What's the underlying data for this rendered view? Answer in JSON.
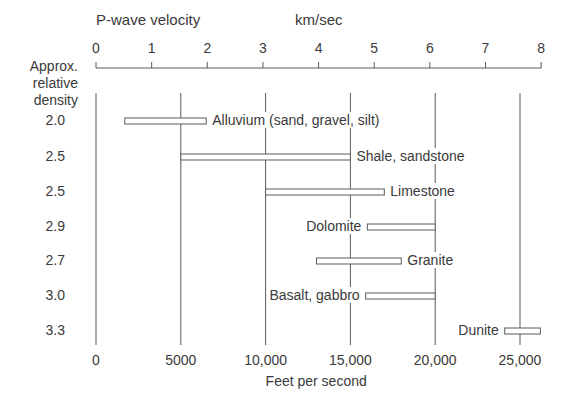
{
  "chart_data": {
    "type": "range-bar",
    "title": "P-wave velocity",
    "top_axis": {
      "label": "km/sec",
      "title": "P-wave velocity",
      "ticks": [
        0,
        1,
        2,
        3,
        4,
        5,
        6,
        7,
        8
      ],
      "range": [
        0,
        8
      ]
    },
    "bottom_axis": {
      "label": "Feet per second",
      "ticks": [
        "0",
        "5000",
        "10,000",
        "15,000",
        "20,000",
        "25,000"
      ],
      "tick_values": [
        0,
        5000,
        10000,
        15000,
        20000,
        25000
      ],
      "range": [
        0,
        26250
      ]
    },
    "left_column_header": [
      "Approx.",
      "relative",
      "density"
    ],
    "rows": [
      {
        "name": "Alluvium (sand, gravel, silt)",
        "density": "2.0",
        "min_fps": 1700,
        "max_fps": 6500,
        "label_side": "right"
      },
      {
        "name": "Shale, sandstone",
        "density": "2.5",
        "min_fps": 5000,
        "max_fps": 15000,
        "label_side": "right"
      },
      {
        "name": "Limestone",
        "density": "2.5",
        "min_fps": 10000,
        "max_fps": 17000,
        "label_side": "right"
      },
      {
        "name": "Dolomite",
        "density": "2.9",
        "min_fps": 16000,
        "max_fps": 20000,
        "label_side": "left"
      },
      {
        "name": "Granite",
        "density": "2.7",
        "min_fps": 13000,
        "max_fps": 18000,
        "label_side": "right"
      },
      {
        "name": "Basalt, gabbro",
        "density": "3.0",
        "min_fps": 15900,
        "max_fps": 20000,
        "label_side": "left"
      },
      {
        "name": "Dunite",
        "density": "3.3",
        "min_fps": 24100,
        "max_fps": 26200,
        "label_side": "left"
      }
    ],
    "gridlines_fps": [
      0,
      5000,
      10000,
      15000,
      20000,
      25000
    ],
    "xlabel": "Feet per second",
    "ylabel": "Approx. relative density"
  }
}
